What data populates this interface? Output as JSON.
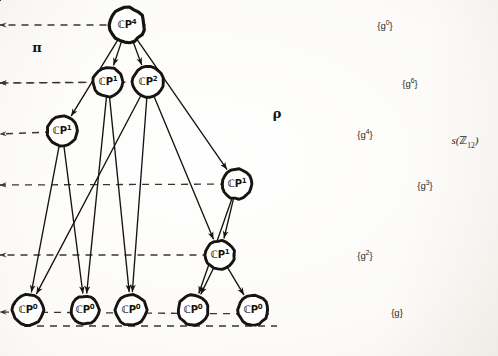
{
  "figure": {
    "width": 498,
    "height": 356,
    "background_color": "#fbfaf8",
    "ink_color": "#17140f"
  },
  "labels": {
    "pi": "π",
    "rho": "ρ",
    "corner_prefix": "s(",
    "corner_bb": "ℤ",
    "corner_sub": "12",
    "corner_suffix": ")"
  },
  "left_nodes": [
    {
      "id": "cp4",
      "base": "ℂP",
      "exp": "4",
      "x": 127,
      "y": 25,
      "r": 17.5
    },
    {
      "id": "cp1a",
      "base": "ℂP",
      "exp": "1",
      "x": 108,
      "y": 82,
      "r": 15.0
    },
    {
      "id": "cp2",
      "base": "ℂP",
      "exp": "2",
      "x": 148,
      "y": 82,
      "r": 15.5
    },
    {
      "id": "cp1b",
      "base": "ℂP",
      "exp": "1",
      "x": 62,
      "y": 131,
      "r": 15.0
    },
    {
      "id": "cp1c",
      "base": "ℂP",
      "exp": "1",
      "x": 237,
      "y": 184,
      "r": 15.0
    },
    {
      "id": "cp1d",
      "base": "ℂP",
      "exp": "1",
      "x": 220,
      "y": 255,
      "r": 14.5
    },
    {
      "id": "cp0a",
      "base": "ℂP",
      "exp": "0",
      "x": 28,
      "y": 310,
      "r": 15.5
    },
    {
      "id": "cp0b",
      "base": "ℂP",
      "exp": "0",
      "x": 85,
      "y": 310,
      "r": 14.0
    },
    {
      "id": "cp0c",
      "base": "ℂP",
      "exp": "0",
      "x": 131,
      "y": 310,
      "r": 15.5
    },
    {
      "id": "cp0d",
      "base": "ℂP",
      "exp": "0",
      "x": 193,
      "y": 310,
      "r": 15.0
    },
    {
      "id": "cp0e",
      "base": "ℂP",
      "exp": "0",
      "x": 253,
      "y": 310,
      "r": 15.0
    }
  ],
  "right_nodes": [
    {
      "id": "g0",
      "text": "{g",
      "exp": "0",
      "close": "}",
      "x": 385,
      "y": 25
    },
    {
      "id": "g6",
      "text": "{g",
      "exp": "6",
      "close": "}",
      "x": 410,
      "y": 83
    },
    {
      "id": "g4",
      "text": "{g",
      "exp": "4",
      "close": "}",
      "x": 365,
      "y": 134
    },
    {
      "id": "g3",
      "text": "{g",
      "exp": "3",
      "close": "}",
      "x": 425,
      "y": 185
    },
    {
      "id": "g2",
      "text": "{g",
      "exp": "2",
      "close": "}",
      "x": 365,
      "y": 255
    },
    {
      "id": "g1",
      "text": "{g",
      "exp": "",
      "close": "}",
      "x": 397,
      "y": 312
    }
  ],
  "left_edges": [
    {
      "from": "cp4",
      "to": "cp1b"
    },
    {
      "from": "cp4",
      "to": "cp1a"
    },
    {
      "from": "cp4",
      "to": "cp2"
    },
    {
      "from": "cp4",
      "to": "cp1c"
    },
    {
      "from": "cp1a",
      "to": "cp0b"
    },
    {
      "from": "cp1a",
      "to": "cp0c"
    },
    {
      "from": "cp2",
      "to": "cp0a"
    },
    {
      "from": "cp2",
      "to": "cp0c"
    },
    {
      "from": "cp2",
      "to": "cp1d"
    },
    {
      "from": "cp1b",
      "to": "cp0a"
    },
    {
      "from": "cp1b",
      "to": "cp0b"
    },
    {
      "from": "cp1c",
      "to": "cp1d"
    },
    {
      "from": "cp1c",
      "to": "cp0d"
    },
    {
      "from": "cp1d",
      "to": "cp0d"
    },
    {
      "from": "cp1d",
      "to": "cp0e"
    }
  ],
  "right_edges": [
    {
      "from": "g0",
      "to": "g6"
    },
    {
      "from": "g0",
      "to": "g4"
    },
    {
      "from": "g6",
      "to": "g3"
    },
    {
      "from": "g6",
      "to": "g2"
    },
    {
      "from": "g4",
      "to": "g2"
    },
    {
      "from": "g3",
      "to": "g1"
    },
    {
      "from": "g2",
      "to": "g1"
    }
  ],
  "dashed_maps": [
    {
      "from": "cp4",
      "to": "g0"
    },
    {
      "from": "cp2",
      "to": "g6"
    },
    {
      "from": "cp1a",
      "to": "g6"
    },
    {
      "from": "cp1b",
      "to": "g4"
    },
    {
      "from": "cp1c",
      "to": "g3"
    },
    {
      "from": "cp1d",
      "to": "g2"
    },
    {
      "from": "cp0e",
      "to": "g1"
    }
  ]
}
